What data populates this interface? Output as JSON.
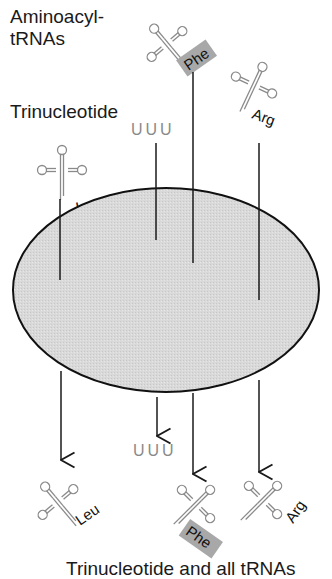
{
  "figure": {
    "label_aminoacyl": "Aminoacyl-",
    "label_trnas": "tRNAs",
    "label_trinucleotide": "Trinucleotide",
    "caption": "Trinucleotide and all tRNAs",
    "filter_color": "#d8d8d8",
    "highlight_color": "#a8a8a8"
  },
  "top": {
    "trinucleotide": "UUU",
    "trnas": [
      {
        "amino_acid": "Leu",
        "highlighted": false
      },
      {
        "amino_acid": "Phe",
        "highlighted": true
      },
      {
        "amino_acid": "Arg",
        "highlighted": false
      }
    ]
  },
  "bottom": {
    "trinucleotide": "UUU",
    "trnas": [
      {
        "amino_acid": "Leu",
        "highlighted": false
      },
      {
        "amino_acid": "Phe",
        "highlighted": true
      },
      {
        "amino_acid": "Arg",
        "highlighted": false
      }
    ]
  }
}
